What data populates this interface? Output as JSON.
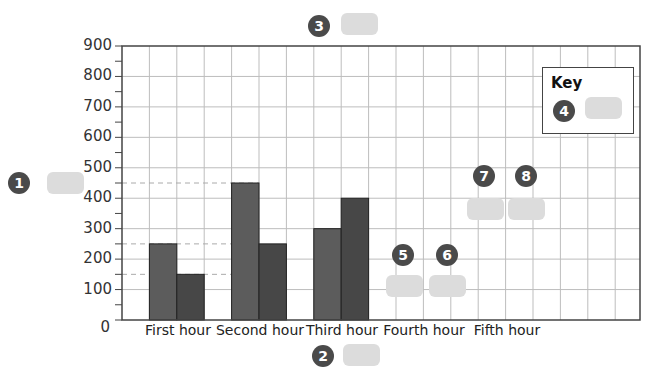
{
  "chart_data": {
    "type": "bar",
    "title": "",
    "xlabel": "",
    "ylabel": "",
    "ylim": [
      0,
      900
    ],
    "yticks": [
      "0",
      "100",
      "200",
      "300",
      "400",
      "500",
      "600",
      "700",
      "800",
      "900"
    ],
    "grid": true,
    "categories": [
      "First hour",
      "Second hour",
      "Third hour",
      "Fourth hour",
      "Fifth hour"
    ],
    "series": [
      {
        "name": "Series A (lighter)",
        "color": "#5c5c5c",
        "values": [
          250,
          450,
          300,
          null,
          null
        ]
      },
      {
        "name": "Series B (darker)",
        "color": "#474747",
        "values": [
          150,
          250,
          400,
          null,
          null
        ]
      }
    ],
    "reference_lines": [
      450,
      250,
      150
    ],
    "legend": {
      "title": "Key",
      "position": "top-right",
      "entries": [
        "4"
      ]
    },
    "annotations": [
      {
        "label": "1",
        "target": "y-axis label blank"
      },
      {
        "label": "2",
        "target": "x-axis label blank"
      },
      {
        "label": "3",
        "target": "title blank"
      },
      {
        "label": "4",
        "target": "key entry blank"
      },
      {
        "label": "5",
        "target": "fourth hour bar A blank"
      },
      {
        "label": "6",
        "target": "fourth hour bar B blank"
      },
      {
        "label": "7",
        "target": "fifth hour bar A blank"
      },
      {
        "label": "8",
        "target": "fifth hour bar B blank"
      }
    ]
  },
  "key": {
    "title": "Key"
  },
  "badges": {
    "b1": "1",
    "b2": "2",
    "b3": "3",
    "b4": "4",
    "b5": "5",
    "b6": "6",
    "b7": "7",
    "b8": "8"
  }
}
